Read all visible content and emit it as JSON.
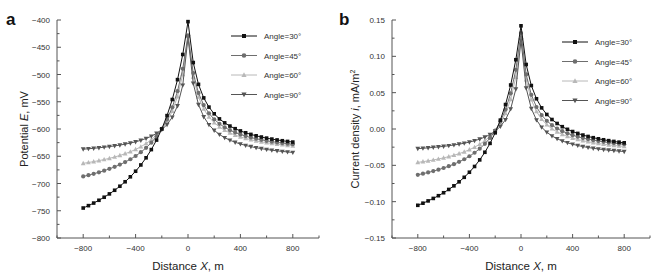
{
  "chart_data": [
    {
      "panel": "a",
      "type": "line",
      "xlabel": "Distance X, m",
      "ylabel": "Potential E, mV",
      "xlim": [
        -1000,
        1000
      ],
      "ylim": [
        -800,
        -400
      ],
      "xticks": [
        -800,
        -400,
        0,
        400,
        800
      ],
      "yticks": [
        -400,
        -450,
        -500,
        -550,
        -600,
        -650,
        -700,
        -750,
        -800
      ],
      "grid": false,
      "legend_position": "upper right",
      "x_range": [
        -800,
        800
      ],
      "x_step": 40,
      "series": [
        {
          "name": "Angle=30°",
          "marker": "square",
          "color": "#111111",
          "peak": -403,
          "left_end": -745,
          "right_end": -624,
          "left_sample": {
            "x": -400,
            "y": -610
          },
          "right_sample": {
            "x": 400,
            "y": -583
          }
        },
        {
          "name": "Angle=45°",
          "marker": "circle",
          "color": "#6e6e6e",
          "peak": -428,
          "left_end": -687,
          "right_end": -628,
          "left_sample": {
            "x": -400,
            "y": -612
          },
          "right_sample": {
            "x": 400,
            "y": -592
          }
        },
        {
          "name": "Angle=60°",
          "marker": "triangle-up",
          "color": "#b8b8b8",
          "peak": -430,
          "left_end": -663,
          "right_end": -631,
          "left_sample": {
            "x": -400,
            "y": -612
          },
          "right_sample": {
            "x": 400,
            "y": -598
          }
        },
        {
          "name": "Angle=90°",
          "marker": "triangle-down",
          "color": "#555555",
          "peak": -432,
          "left_end": -637,
          "right_end": -643,
          "left_sample": {
            "x": -400,
            "y": -610
          },
          "right_sample": {
            "x": 400,
            "y": -612
          }
        }
      ]
    },
    {
      "panel": "b",
      "type": "line",
      "xlabel": "Distance X, m",
      "ylabel": "Current density i, mA/m²",
      "xlim": [
        -1000,
        1000
      ],
      "ylim": [
        -0.15,
        0.15
      ],
      "xticks": [
        -800,
        -400,
        0,
        400,
        800
      ],
      "yticks": [
        0.15,
        0.1,
        0.05,
        0.0,
        -0.05,
        -0.1,
        -0.15
      ],
      "grid": false,
      "legend_position": "upper right",
      "x_range": [
        -800,
        800
      ],
      "x_step": 40,
      "series": [
        {
          "name": "Angle=30°",
          "marker": "square",
          "color": "#111111",
          "peak": 0.142,
          "left_end": -0.105,
          "right_end": -0.019,
          "left_sample": {
            "x": -400,
            "y": -0.014
          },
          "right_sample": {
            "x": 400,
            "y": 0.012
          }
        },
        {
          "name": "Angle=45°",
          "marker": "circle",
          "color": "#6e6e6e",
          "peak": 0.132,
          "left_end": -0.063,
          "right_end": -0.021,
          "left_sample": {
            "x": -400,
            "y": -0.012
          },
          "right_sample": {
            "x": 400,
            "y": 0.004
          }
        },
        {
          "name": "Angle=60°",
          "marker": "triangle-up",
          "color": "#b8b8b8",
          "peak": 0.126,
          "left_end": -0.046,
          "right_end": -0.024,
          "left_sample": {
            "x": -400,
            "y": -0.011
          },
          "right_sample": {
            "x": 400,
            "y": -0.001
          }
        },
        {
          "name": "Angle=90°",
          "marker": "triangle-down",
          "color": "#555555",
          "peak": 0.122,
          "left_end": -0.027,
          "right_end": -0.031,
          "left_sample": {
            "x": -400,
            "y": -0.009
          },
          "right_sample": {
            "x": 400,
            "y": -0.011
          }
        }
      ]
    }
  ],
  "panels": {
    "a": {
      "label": "a",
      "xlabel_pre": "Distance ",
      "xlabel_var": "X",
      "xlabel_post": ", m",
      "ylabel_pre": "Potential ",
      "ylabel_var": "E",
      "ylabel_post": ", mV"
    },
    "b": {
      "label": "b",
      "xlabel_pre": "Distance ",
      "xlabel_var": "X",
      "xlabel_post": ", m",
      "ylabel_pre": "Current density ",
      "ylabel_var": "i",
      "ylabel_post": ", mA/m",
      "ylabel_sup": "2"
    }
  }
}
